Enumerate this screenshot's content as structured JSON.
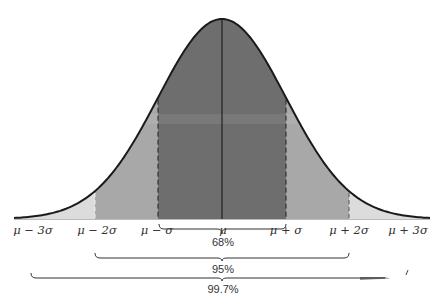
{
  "diagram": {
    "title": "",
    "type": "normal-distribution-empirical-rule",
    "colors": {
      "band_1sigma": "#6e6e6e",
      "band_2sigma": "#a6a6a6",
      "band_3sigma": "#dcdcdc",
      "curve": "#1a1a1a",
      "background": "#ffffff"
    },
    "axis_labels": [
      {
        "id": "m3",
        "text": "μ − 3σ"
      },
      {
        "id": "m2",
        "text": "μ − 2σ"
      },
      {
        "id": "m1",
        "text": "μ − σ"
      },
      {
        "id": "mu",
        "text": "μ"
      },
      {
        "id": "p1",
        "text": "μ + σ"
      },
      {
        "id": "p2",
        "text": "μ + 2σ"
      },
      {
        "id": "p3",
        "text": "μ + 3σ"
      }
    ],
    "brackets": [
      {
        "label": "68%",
        "range": "μ ± σ"
      },
      {
        "label": "95%",
        "range": "μ ± 2σ"
      },
      {
        "label": "99.7%",
        "range": "μ ± 3σ"
      }
    ]
  }
}
